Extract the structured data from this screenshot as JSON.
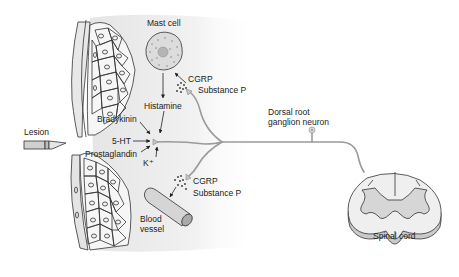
{
  "labels": {
    "mast_cell": "Mast cell",
    "cgrp_top": "CGRP",
    "substance_p_top": "Substance P",
    "histamine": "Histamine",
    "bradykinin": "Bradykinin",
    "five_ht": "5-HT",
    "prostaglandin": "Prostaglandin",
    "k_plus": "K⁺",
    "lesion": "Lesion",
    "cgrp_bottom": "CGRP",
    "substance_p_bottom": "Substance P",
    "blood_vessel_line1": "Blood",
    "blood_vessel_line2": "vessel",
    "drg_line1": "Dorsal root",
    "drg_line2": "ganglion neuron",
    "spinal_cord": "Spinal cord"
  },
  "colors": {
    "tissue_fill": "#ececec",
    "cell_stroke": "#333333",
    "neuron_stroke": "#9a9a9a",
    "grey_matter": "#d6d6d6",
    "white_matter": "#eeeeee",
    "vessel_fill": "#d9d9d9",
    "mast_cell_fill": "#dcdcdc"
  }
}
